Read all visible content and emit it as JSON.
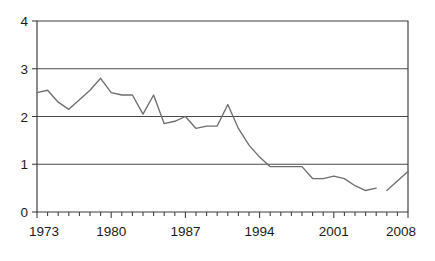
{
  "chart_data": {
    "type": "line",
    "title": "",
    "subtitle": "",
    "xlabel": "",
    "ylabel": "",
    "xlim": [
      1973,
      2008
    ],
    "ylim": [
      0,
      4
    ],
    "grid": "horizontal",
    "legend": "none",
    "y_ticks": [
      0,
      1,
      2,
      3,
      4
    ],
    "y_tick_labels": [
      "0",
      "1",
      "2",
      "3",
      "4"
    ],
    "x_ticks": [
      1973,
      1974,
      1975,
      1976,
      1977,
      1978,
      1979,
      1980,
      1981,
      1982,
      1983,
      1984,
      1985,
      1986,
      1987,
      1988,
      1989,
      1990,
      1991,
      1992,
      1993,
      1994,
      1995,
      1996,
      1997,
      1998,
      1999,
      2000,
      2001,
      2002,
      2003,
      2004,
      2005,
      2006,
      2007,
      2008
    ],
    "x_tick_labels": [
      "1973",
      "1980",
      "1987",
      "1994",
      "2001",
      "2008"
    ],
    "x_labeled_ticks": [
      1973,
      1980,
      1987,
      1994,
      2001,
      2008
    ],
    "line_color": "#6e6e6e",
    "series": [
      {
        "name": "series-1",
        "x": [
          1973,
          1974,
          1975,
          1976,
          1977,
          1978,
          1979,
          1980,
          1981,
          1982,
          1983,
          1984,
          1985,
          1986,
          1987,
          1988,
          1989,
          1990,
          1991,
          1992,
          1993,
          1994,
          1995,
          1996,
          1997,
          1998,
          1999,
          2000,
          2001,
          2002,
          2003,
          2004,
          2005
        ],
        "values": [
          2.5,
          2.55,
          2.3,
          2.15,
          2.35,
          2.55,
          2.8,
          2.5,
          2.45,
          2.45,
          2.05,
          2.45,
          1.85,
          1.9,
          2.0,
          1.75,
          1.8,
          1.8,
          2.25,
          1.75,
          1.4,
          1.15,
          0.95,
          0.95,
          0.95,
          0.95,
          0.7,
          0.7,
          0.75,
          0.7,
          0.55,
          0.45,
          0.5
        ]
      },
      {
        "name": "series-1-segment-2",
        "x": [
          2006,
          2007,
          2008
        ],
        "values": [
          0.45,
          0.65,
          0.85
        ]
      }
    ]
  }
}
